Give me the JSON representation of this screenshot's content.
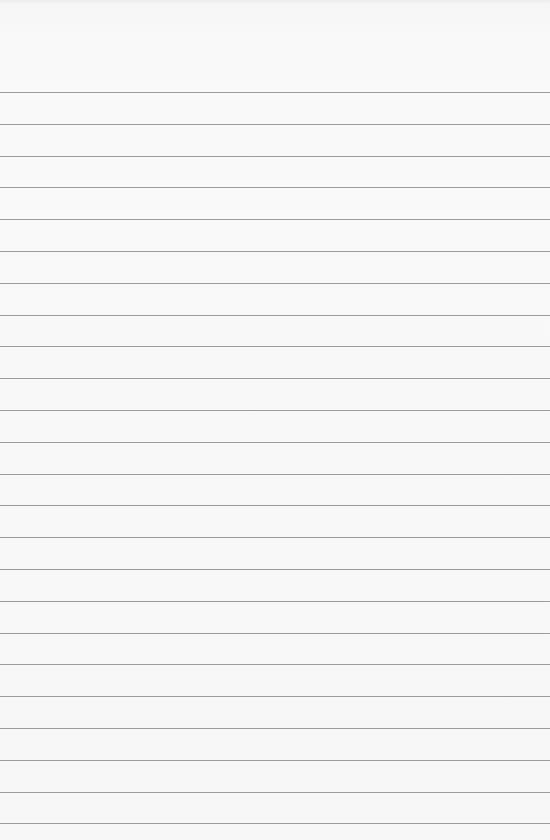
{
  "paper": {
    "type": "lined-notebook-paper",
    "background_color": "#f7f7f7",
    "rule_color": "#8c8c8c",
    "rule_count": 24,
    "first_rule_y": 92,
    "rule_spacing_px": 31.8,
    "text_content": ""
  }
}
